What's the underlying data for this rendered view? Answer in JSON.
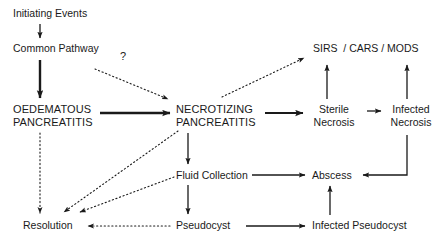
{
  "diagram": {
    "style": {
      "background": "#ffffff",
      "text_color": "#1a1a1a",
      "edge_color": "#1a1a1a"
    },
    "nodes": [
      {
        "id": "initiating",
        "label": "Initiating Events"
      },
      {
        "id": "common",
        "label": "Common Pathway"
      },
      {
        "id": "oedematous",
        "label": "OEDEMATOUS\nPANCREATITIS"
      },
      {
        "id": "necrotizing",
        "label": "NECROTIZING\nPANCREATITIS"
      },
      {
        "id": "sirs",
        "label": "SIRS  / CARS / MODS"
      },
      {
        "id": "sterile",
        "label": "Sterile\nNecrosis"
      },
      {
        "id": "infectednec",
        "label": "Infected\nNecrosis"
      },
      {
        "id": "fluid",
        "label": "Fluid Collection"
      },
      {
        "id": "abscess",
        "label": "Abscess"
      },
      {
        "id": "resolution",
        "label": "Resolution"
      },
      {
        "id": "pseudocyst",
        "label": "Pseudocyst"
      },
      {
        "id": "infectedps",
        "label": "Infected Pseudocyst"
      }
    ],
    "edge_labels": [
      {
        "id": "question",
        "label": "?"
      }
    ],
    "edges": [
      {
        "from": "initiating",
        "to": "common",
        "style": "solid",
        "weight": "thin"
      },
      {
        "from": "common",
        "to": "oedematous",
        "style": "solid",
        "weight": "thick"
      },
      {
        "from": "common",
        "to": "necrotizing",
        "style": "dotted",
        "weight": "thin",
        "label": "?"
      },
      {
        "from": "oedematous",
        "to": "necrotizing",
        "style": "solid",
        "weight": "thick"
      },
      {
        "from": "oedematous",
        "to": "resolution",
        "style": "dotted",
        "weight": "thin"
      },
      {
        "from": "necrotizing",
        "to": "sirs",
        "style": "dotted",
        "weight": "thin"
      },
      {
        "from": "necrotizing",
        "to": "sterile",
        "style": "solid",
        "weight": "thick"
      },
      {
        "from": "necrotizing",
        "to": "fluid",
        "style": "solid",
        "weight": "thin"
      },
      {
        "from": "necrotizing",
        "to": "resolution",
        "style": "dotted",
        "weight": "thin"
      },
      {
        "from": "sterile",
        "to": "infectednec",
        "style": "solid",
        "weight": "thin"
      },
      {
        "from": "sterile",
        "to": "sirs",
        "style": "solid",
        "weight": "thin"
      },
      {
        "from": "infectednec",
        "to": "sirs",
        "style": "solid",
        "weight": "thin"
      },
      {
        "from": "infectednec",
        "to": "abscess",
        "style": "solid",
        "weight": "thin"
      },
      {
        "from": "fluid",
        "to": "abscess",
        "style": "solid",
        "weight": "thin"
      },
      {
        "from": "fluid",
        "to": "pseudocyst",
        "style": "solid",
        "weight": "thin"
      },
      {
        "from": "fluid",
        "to": "resolution",
        "style": "dotted",
        "weight": "thin"
      },
      {
        "from": "pseudocyst",
        "to": "infectedps",
        "style": "solid",
        "weight": "thin"
      },
      {
        "from": "pseudocyst",
        "to": "resolution",
        "style": "dotted",
        "weight": "thin"
      },
      {
        "from": "infectedps",
        "to": "abscess",
        "style": "solid",
        "weight": "thin"
      }
    ]
  }
}
